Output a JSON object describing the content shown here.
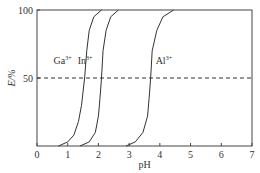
{
  "chart_data": {
    "type": "line",
    "title": "",
    "xlabel": "pH",
    "ylabel": "E/%",
    "xlim": [
      0,
      7
    ],
    "ylim": [
      0,
      100
    ],
    "xticks": [
      "0",
      "1",
      "2",
      "3",
      "4",
      "5",
      "6",
      "7"
    ],
    "yticks": [
      "50",
      "100"
    ],
    "reference_line": {
      "y": 50,
      "style": "dashed"
    },
    "grid": false,
    "series": [
      {
        "name": "Ga3+",
        "label_base": "Ga",
        "label_sup": "3+",
        "points": [
          [
            0.7,
            0
          ],
          [
            1.0,
            3
          ],
          [
            1.2,
            8
          ],
          [
            1.35,
            18
          ],
          [
            1.45,
            30
          ],
          [
            1.55,
            50
          ],
          [
            1.62,
            70
          ],
          [
            1.7,
            85
          ],
          [
            1.85,
            95
          ],
          [
            2.1,
            100
          ]
        ]
      },
      {
        "name": "In3+",
        "label_base": "In",
        "label_sup": "3+",
        "points": [
          [
            1.4,
            0
          ],
          [
            1.7,
            3
          ],
          [
            1.9,
            10
          ],
          [
            2.0,
            22
          ],
          [
            2.05,
            35
          ],
          [
            2.1,
            50
          ],
          [
            2.15,
            70
          ],
          [
            2.25,
            85
          ],
          [
            2.4,
            95
          ],
          [
            2.65,
            100
          ]
        ]
      },
      {
        "name": "Al3+",
        "label_base": "Al",
        "label_sup": "3+",
        "points": [
          [
            2.9,
            0
          ],
          [
            3.2,
            3
          ],
          [
            3.45,
            10
          ],
          [
            3.6,
            22
          ],
          [
            3.65,
            35
          ],
          [
            3.7,
            50
          ],
          [
            3.75,
            70
          ],
          [
            3.9,
            85
          ],
          [
            4.1,
            95
          ],
          [
            4.45,
            100
          ]
        ]
      }
    ]
  }
}
